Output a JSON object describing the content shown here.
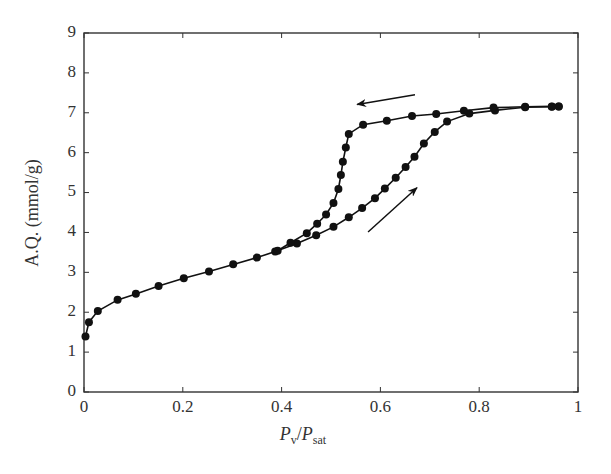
{
  "chart_data": {
    "type": "line",
    "title": "",
    "xlabel": "Pv/Psat",
    "xlabel_parts": {
      "main": "P",
      "sub1": "v",
      "sep": "/",
      "main2": "P",
      "sub2": "sat"
    },
    "ylabel": "A.Q. (mmol/g)",
    "xlim": [
      0,
      1
    ],
    "ylim": [
      0,
      9
    ],
    "xticks": [
      0,
      0.2,
      0.4,
      0.6,
      0.8,
      1
    ],
    "xtick_labels": [
      "0",
      "0.2",
      "0.4",
      "0.6",
      "0.8",
      "1"
    ],
    "yticks": [
      0,
      1,
      2,
      3,
      4,
      5,
      6,
      7,
      8,
      9
    ],
    "ytick_labels": [
      "0",
      "1",
      "2",
      "3",
      "4",
      "5",
      "6",
      "7",
      "8",
      "9"
    ],
    "grid": false,
    "legend": null,
    "marker": "filled-circle",
    "color": "#111111",
    "series": [
      {
        "name": "adsorption",
        "x": [
          0.003,
          0.01,
          0.028,
          0.068,
          0.105,
          0.151,
          0.202,
          0.253,
          0.302,
          0.35,
          0.387,
          0.431,
          0.47,
          0.505,
          0.536,
          0.563,
          0.589,
          0.609,
          0.631,
          0.651,
          0.669,
          0.688,
          0.71,
          0.735,
          0.78,
          0.832,
          0.893,
          0.947,
          0.961
        ],
        "y": [
          1.39,
          1.75,
          2.03,
          2.31,
          2.46,
          2.66,
          2.85,
          3.02,
          3.2,
          3.37,
          3.52,
          3.72,
          3.93,
          4.14,
          4.38,
          4.61,
          4.86,
          5.1,
          5.37,
          5.64,
          5.9,
          6.23,
          6.52,
          6.78,
          6.98,
          7.06,
          7.14,
          7.15,
          7.16
        ]
      },
      {
        "name": "desorption",
        "x": [
          0.961,
          0.947,
          0.893,
          0.829,
          0.769,
          0.713,
          0.664,
          0.613,
          0.565,
          0.536,
          0.53,
          0.524,
          0.52,
          0.515,
          0.505,
          0.49,
          0.472,
          0.451,
          0.418,
          0.392
        ],
        "y": [
          7.16,
          7.16,
          7.15,
          7.13,
          7.05,
          6.97,
          6.92,
          6.8,
          6.7,
          6.47,
          6.13,
          5.77,
          5.44,
          5.09,
          4.74,
          4.45,
          4.22,
          3.98,
          3.74,
          3.54
        ]
      }
    ],
    "annotations": [
      {
        "type": "arrow",
        "label": "desorption-direction",
        "from": [
          0.67,
          7.45
        ],
        "to": [
          0.553,
          7.21
        ]
      },
      {
        "type": "arrow",
        "label": "adsorption-direction",
        "from": [
          0.575,
          4.01
        ],
        "to": [
          0.674,
          5.12
        ]
      }
    ]
  }
}
